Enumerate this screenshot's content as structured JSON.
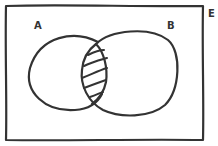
{
  "diagram": {
    "type": "venn",
    "universe_label": "E",
    "sets": [
      {
        "label": "A"
      },
      {
        "label": "B"
      }
    ],
    "shaded_region": "A ∩ B",
    "colors": {
      "stroke": "#333333",
      "background": "#ffffff"
    }
  }
}
